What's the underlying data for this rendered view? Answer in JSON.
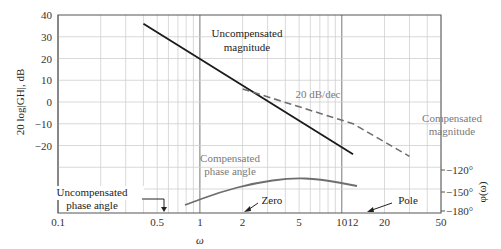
{
  "chart_data": {
    "type": "line",
    "title": "",
    "xlabel": "ω",
    "ylabel": "20 log|GH|, dB",
    "ylabel_right": "φ(ω)",
    "xscale": "log",
    "xlim": [
      0.1,
      50
    ],
    "ylim": [
      -40,
      40
    ],
    "grid": true,
    "x_ticks": [
      {
        "value": 0.1,
        "label": "0.1"
      },
      {
        "value": 0.5,
        "label": "0.5"
      },
      {
        "value": 1,
        "label": "1"
      },
      {
        "value": 2,
        "label": "2"
      },
      {
        "value": 5,
        "label": "5"
      },
      {
        "value": 10,
        "label": "10"
      },
      {
        "value": 12,
        "label": "12"
      },
      {
        "value": 20,
        "label": "20"
      },
      {
        "value": 50,
        "label": "50"
      }
    ],
    "y_ticks": [
      {
        "value": 40,
        "label": "40"
      },
      {
        "value": 30,
        "label": "30"
      },
      {
        "value": 20,
        "label": "20"
      },
      {
        "value": 10,
        "label": "10"
      },
      {
        "value": 0,
        "label": "0"
      },
      {
        "value": -10,
        "label": "−10"
      },
      {
        "value": -20,
        "label": "−20"
      }
    ],
    "phase_ticks": [
      {
        "y": 170,
        "label": "−120°"
      },
      {
        "y": 192,
        "label": "−150°"
      },
      {
        "y": 211,
        "label": "−180°"
      }
    ],
    "series": [
      {
        "name": "Uncompensated magnitude",
        "style": "solid",
        "color": "#1a1a1a",
        "points": [
          [
            0.4,
            36
          ],
          [
            12,
            -24
          ]
        ]
      },
      {
        "name": "Compensated magnitude",
        "style": "dashed",
        "color": "#6e6e6e",
        "points": [
          [
            2,
            6
          ],
          [
            12,
            -10
          ],
          [
            30,
            -25
          ]
        ]
      },
      {
        "name": "Compensated phase angle",
        "style": "solid",
        "color": "#6e6e6e",
        "phase_pixels": [
          [
            185,
            205
          ],
          [
            220,
            192
          ],
          [
            255,
            183
          ],
          [
            290,
            178
          ],
          [
            320,
            179
          ],
          [
            357,
            186
          ]
        ]
      }
    ],
    "annotations": [
      {
        "text_lines": [
          "Uncompensated",
          "magnitude"
        ],
        "x": 247,
        "y": 37,
        "color": "#222"
      },
      {
        "text_lines": [
          "20 dB/dec"
        ],
        "x": 318,
        "y": 98,
        "color": "#7a7a7a"
      },
      {
        "text_lines": [
          "Compensated",
          "magnitude"
        ],
        "x": 452,
        "y": 122,
        "color": "#7a7a7a"
      },
      {
        "text_lines": [
          "Compensated",
          "phase angle"
        ],
        "x": 230,
        "y": 162,
        "color": "#7a7a7a"
      },
      {
        "text_lines": [
          "Uncompensated",
          "phase angle"
        ],
        "x": 92,
        "y": 196,
        "color": "#222"
      },
      {
        "text_lines": [
          "Zero"
        ],
        "x": 258,
        "y": 203,
        "color": "#222"
      },
      {
        "text_lines": [
          "Pole"
        ],
        "x": 394,
        "y": 203,
        "color": "#222"
      }
    ]
  },
  "labels": {
    "ylabel": "20 log|GH|, dB",
    "ylabel_right": "φ(ω)",
    "xlabel": "ω",
    "ann_uncomp_mag_1": "Uncompensated",
    "ann_uncomp_mag_2": "magnitude",
    "ann_slope": "20 dB/dec",
    "ann_comp_mag_1": "Compensated",
    "ann_comp_mag_2": "magnitude",
    "ann_comp_phase_1": "Compensated",
    "ann_comp_phase_2": "phase angle",
    "ann_uncomp_phase_1": "Uncompensated",
    "ann_uncomp_phase_2": "phase angle",
    "ann_zero": "Zero",
    "ann_pole": "Pole"
  }
}
